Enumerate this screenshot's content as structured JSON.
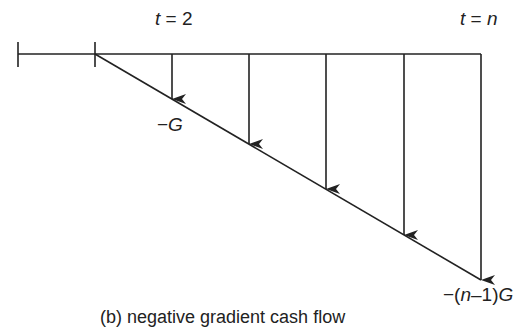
{
  "diagram": {
    "labels": {
      "t2_var": "t",
      "t2_rest": " = 2",
      "tn_var": "t",
      "tn_eq": " = ",
      "tn_n": "n",
      "first_amount_sign": "−",
      "first_amount_var": "G",
      "last_amount_prefix": "−(",
      "last_amount_n": "n",
      "last_amount_mid": "–1)",
      "last_amount_var": "G"
    },
    "caption": "(b) negative gradient cash flow",
    "colors": {
      "line": "#222222",
      "background": "#ffffff"
    },
    "timeline": {
      "x_start": 18,
      "x_end": 481,
      "y": 54,
      "ticks_x": [
        18,
        95
      ]
    },
    "gradient_line": {
      "from": [
        95,
        54
      ],
      "to": [
        481,
        280
      ]
    },
    "arrows": [
      {
        "period": "t=2",
        "x": 172,
        "y_end": 99
      },
      {
        "period": "t=3",
        "x": 249,
        "y_end": 144
      },
      {
        "period": "t=4",
        "x": 326,
        "y_end": 189
      },
      {
        "period": "t=5",
        "x": 404,
        "y_end": 235
      },
      {
        "period": "t=n",
        "x": 481,
        "y_end": 280
      }
    ]
  }
}
